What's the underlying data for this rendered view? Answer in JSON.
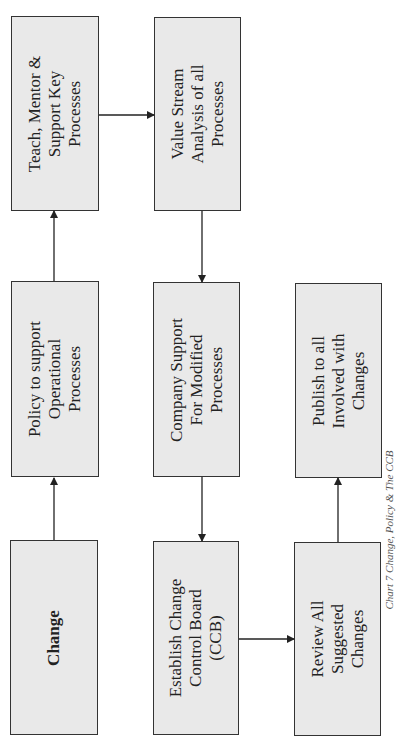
{
  "caption": "Chart 7  Change, Policy & The CCB",
  "nodes": {
    "change": "Change",
    "policy": "Policy to support\nOperational\nProcesses",
    "teach": "Teach, Mentor &\nSupport Key\nProcesses",
    "value_stream": "Value Stream\nAnalysis of all\nProcesses",
    "company_support": "Company Support\nFor Modified\nProcesses",
    "ccb": "Establish Change\nControl Board\n(CCB)",
    "review": "Review All\nSuggested\nChanges",
    "publish": "Publish to all\nInvolved with\nChanges"
  },
  "edges": [
    {
      "from": "change",
      "to": "policy"
    },
    {
      "from": "policy",
      "to": "teach"
    },
    {
      "from": "teach",
      "to": "value_stream"
    },
    {
      "from": "value_stream",
      "to": "company_support"
    },
    {
      "from": "company_support",
      "to": "ccb"
    },
    {
      "from": "ccb",
      "to": "review"
    },
    {
      "from": "review",
      "to": "publish"
    }
  ],
  "colors": {
    "box_fill": "#e9e9e9",
    "box_border": "#333333",
    "arrow": "#222222"
  }
}
